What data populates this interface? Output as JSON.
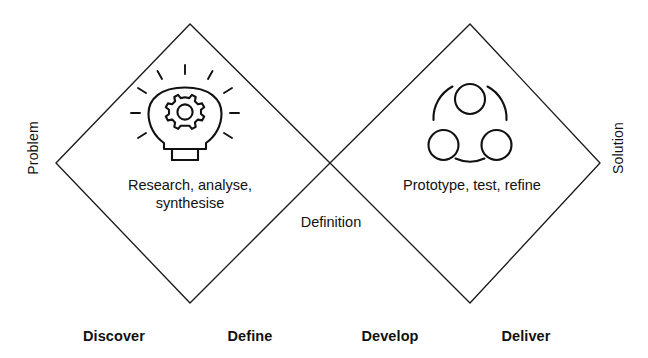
{
  "diagram": {
    "axis_labels": {
      "left": "Problem",
      "right": "Solution"
    },
    "diamonds": [
      {
        "id": "problem-diamond",
        "inner_text": "Research, analyse,\nsynthesise",
        "icon": "lightbulb-gear-icon",
        "stages": [
          "Discover",
          "Define"
        ]
      },
      {
        "id": "solution-diamond",
        "inner_text": "Prototype, test, refine",
        "icon": "three-circles-icon",
        "stages": [
          "Develop",
          "Deliver"
        ]
      }
    ],
    "center_label": "Definition",
    "stages": [
      {
        "key": "discover",
        "label": "Discover"
      },
      {
        "key": "define",
        "label": "Define"
      },
      {
        "key": "develop",
        "label": "Develop"
      },
      {
        "key": "deliver",
        "label": "Deliver"
      }
    ],
    "colors": {
      "background": "#ffffff",
      "stroke": "#1a1a1a",
      "text": "#111111"
    }
  }
}
